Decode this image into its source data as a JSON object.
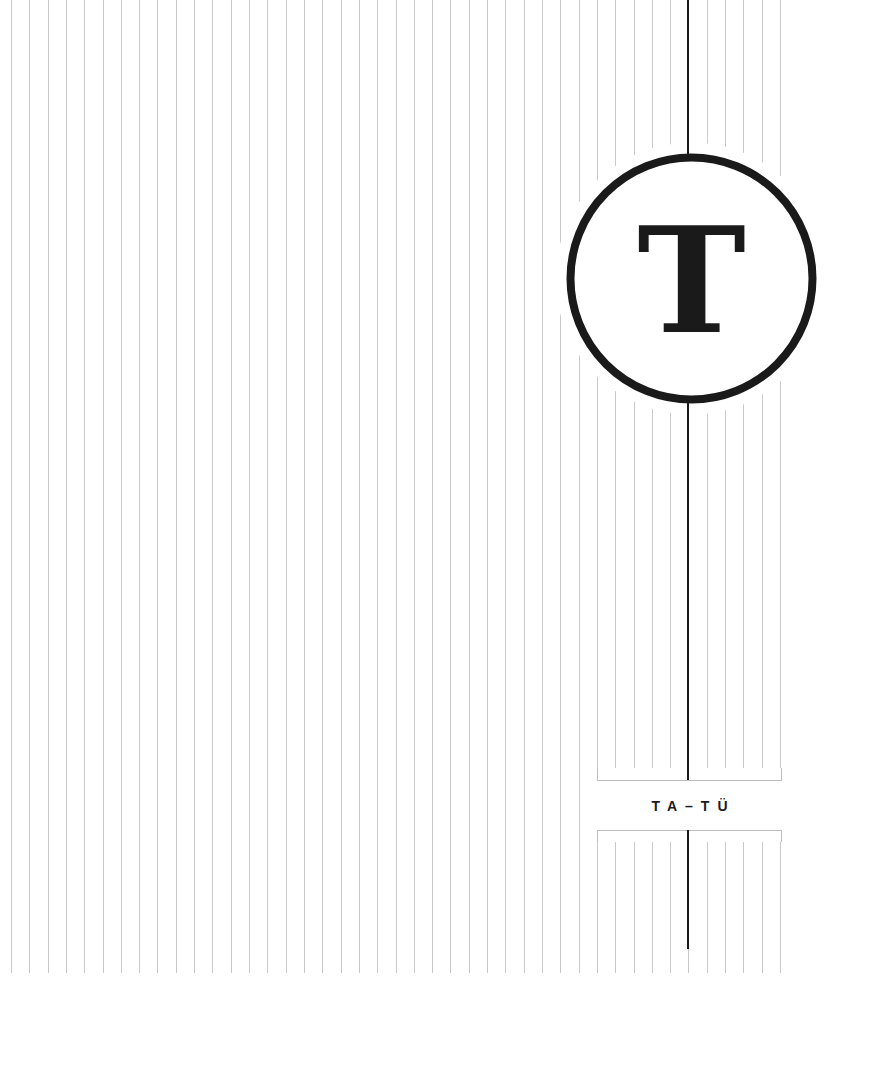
{
  "page": {
    "width": 872,
    "height": 1077,
    "background": "#ffffff"
  },
  "divider": {
    "letter": "T",
    "range_label": "TA–TÜ"
  },
  "rules": {
    "count": 43,
    "first_x": 11,
    "spacing": 18.31,
    "top_y": 0,
    "bottom_y": 973,
    "color": "#c9c9c9",
    "width": 1
  },
  "spine": {
    "x": 688,
    "top_y": 0,
    "bottom_y": 949,
    "color": "#1a1a1a",
    "width": 2
  },
  "badge_circle": {
    "cx": 691.5,
    "cy": 278.5,
    "r": 121,
    "stroke_width": 8,
    "halo_r": 136,
    "color": "#1a1a1a"
  },
  "label_box": {
    "left": 597,
    "right": 781,
    "top_rule_y": 780,
    "bottom_rule_y": 830,
    "inner_gap": 12,
    "border_color": "#bdbdbd"
  }
}
